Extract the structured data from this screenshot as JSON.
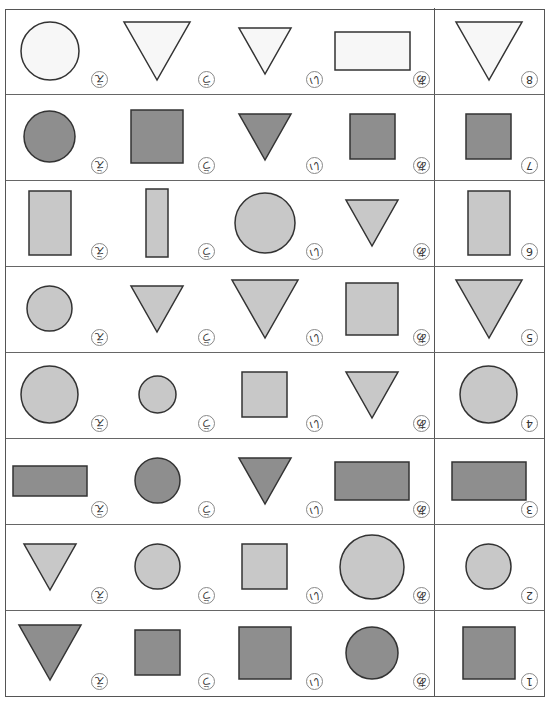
{
  "worksheet": {
    "orientation_deg": 180,
    "colors": {
      "white": "#f7f7f7",
      "light": "#c8c8c8",
      "dark": "#8e8e8e",
      "stroke": "#333333"
    },
    "option_labels": [
      "あ",
      "い",
      "う",
      "え"
    ],
    "rows": [
      {
        "number": "1",
        "reference": {
          "shape": "square",
          "tone": "dark",
          "w": 52,
          "h": 52
        },
        "options": [
          {
            "label": "あ",
            "shape": "circle",
            "tone": "dark",
            "w": 52,
            "h": 52
          },
          {
            "label": "い",
            "shape": "square",
            "tone": "dark",
            "w": 52,
            "h": 52
          },
          {
            "label": "う",
            "shape": "square",
            "tone": "dark",
            "w": 45,
            "h": 45
          },
          {
            "label": "え",
            "shape": "triangle",
            "tone": "dark",
            "w": 62,
            "h": 55
          }
        ]
      },
      {
        "number": "2",
        "reference": {
          "shape": "circle",
          "tone": "light",
          "w": 45,
          "h": 45
        },
        "options": [
          {
            "label": "あ",
            "shape": "circle",
            "tone": "light",
            "w": 64,
            "h": 64
          },
          {
            "label": "い",
            "shape": "square",
            "tone": "light",
            "w": 45,
            "h": 45
          },
          {
            "label": "う",
            "shape": "circle",
            "tone": "light",
            "w": 45,
            "h": 45
          },
          {
            "label": "え",
            "shape": "triangle",
            "tone": "light",
            "w": 52,
            "h": 46
          }
        ]
      },
      {
        "number": "3",
        "reference": {
          "shape": "rectangle",
          "tone": "dark",
          "w": 74,
          "h": 38
        },
        "options": [
          {
            "label": "あ",
            "shape": "rectangle",
            "tone": "dark",
            "w": 74,
            "h": 38
          },
          {
            "label": "い",
            "shape": "triangle",
            "tone": "dark",
            "w": 52,
            "h": 46
          },
          {
            "label": "う",
            "shape": "circle",
            "tone": "dark",
            "w": 45,
            "h": 45
          },
          {
            "label": "え",
            "shape": "rectangle",
            "tone": "dark",
            "w": 74,
            "h": 30
          }
        ]
      },
      {
        "number": "4",
        "reference": {
          "shape": "circle",
          "tone": "light",
          "w": 57,
          "h": 57
        },
        "options": [
          {
            "label": "あ",
            "shape": "triangle",
            "tone": "light",
            "w": 52,
            "h": 46
          },
          {
            "label": "い",
            "shape": "square",
            "tone": "light",
            "w": 45,
            "h": 45
          },
          {
            "label": "う",
            "shape": "circle",
            "tone": "light",
            "w": 37,
            "h": 37
          },
          {
            "label": "え",
            "shape": "circle",
            "tone": "light",
            "w": 57,
            "h": 57
          }
        ]
      },
      {
        "number": "5",
        "reference": {
          "shape": "triangle",
          "tone": "light",
          "w": 66,
          "h": 58
        },
        "options": [
          {
            "label": "あ",
            "shape": "square",
            "tone": "light",
            "w": 52,
            "h": 52
          },
          {
            "label": "い",
            "shape": "triangle",
            "tone": "light",
            "w": 66,
            "h": 58
          },
          {
            "label": "う",
            "shape": "triangle",
            "tone": "light",
            "w": 52,
            "h": 46
          },
          {
            "label": "え",
            "shape": "circle",
            "tone": "light",
            "w": 45,
            "h": 45
          }
        ]
      },
      {
        "number": "6",
        "reference": {
          "shape": "rectangle",
          "tone": "light",
          "w": 42,
          "h": 64
        },
        "options": [
          {
            "label": "あ",
            "shape": "triangle",
            "tone": "light",
            "w": 52,
            "h": 46
          },
          {
            "label": "い",
            "shape": "circle",
            "tone": "light",
            "w": 60,
            "h": 60
          },
          {
            "label": "う",
            "shape": "rectangle",
            "tone": "light",
            "w": 22,
            "h": 68
          },
          {
            "label": "え",
            "shape": "rectangle",
            "tone": "light",
            "w": 42,
            "h": 64
          }
        ]
      },
      {
        "number": "7",
        "reference": {
          "shape": "square",
          "tone": "dark",
          "w": 45,
          "h": 45
        },
        "options": [
          {
            "label": "あ",
            "shape": "square",
            "tone": "dark",
            "w": 45,
            "h": 45
          },
          {
            "label": "い",
            "shape": "triangle",
            "tone": "dark",
            "w": 52,
            "h": 46
          },
          {
            "label": "う",
            "shape": "square",
            "tone": "dark",
            "w": 52,
            "h": 53
          },
          {
            "label": "え",
            "shape": "circle",
            "tone": "dark",
            "w": 51,
            "h": 51
          }
        ]
      },
      {
        "number": "8",
        "reference": {
          "shape": "triangle",
          "tone": "white",
          "w": 66,
          "h": 58
        },
        "options": [
          {
            "label": "あ",
            "shape": "rectangle",
            "tone": "white",
            "w": 75,
            "h": 38
          },
          {
            "label": "い",
            "shape": "triangle",
            "tone": "white",
            "w": 52,
            "h": 46
          },
          {
            "label": "う",
            "shape": "triangle",
            "tone": "white",
            "w": 66,
            "h": 58
          },
          {
            "label": "え",
            "shape": "circle",
            "tone": "white",
            "w": 58,
            "h": 58
          }
        ]
      }
    ]
  }
}
